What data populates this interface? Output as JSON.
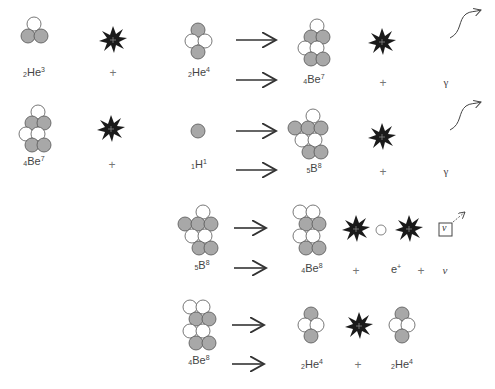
{
  "diagram": {
    "colors": {
      "proton": "#a8a8a8",
      "neutron": "#ffffff",
      "outline": "#555555",
      "energy_burst": "#1a1a1a"
    },
    "rows": [
      {
        "id": "row1",
        "terms": [
          {
            "type": "nucleus",
            "symbol": "He",
            "Z": "2",
            "A": "3",
            "label_x": 34
          },
          {
            "type": "plus",
            "text": "+",
            "x": 113
          },
          {
            "type": "nucleus",
            "symbol": "He",
            "Z": "2",
            "A": "4",
            "label_x": 199
          },
          {
            "type": "arrow"
          },
          {
            "type": "nucleus",
            "symbol": "Be",
            "Z": "4",
            "A": "7",
            "label_x": 314
          },
          {
            "type": "plus",
            "text": "+",
            "x": 383
          },
          {
            "type": "gamma",
            "text": "γ",
            "x": 446
          }
        ]
      },
      {
        "id": "row2",
        "terms": [
          {
            "type": "nucleus",
            "symbol": "Be",
            "Z": "4",
            "A": "7",
            "label_x": 34
          },
          {
            "type": "plus",
            "text": "+",
            "x": 112
          },
          {
            "type": "nucleus",
            "symbol": "H",
            "Z": "1",
            "A": "1",
            "label_x": 199
          },
          {
            "type": "arrow"
          },
          {
            "type": "nucleus",
            "symbol": "B",
            "Z": "5",
            "A": "8",
            "label_x": 314
          },
          {
            "type": "plus",
            "text": "+",
            "x": 383
          },
          {
            "type": "gamma",
            "text": "γ",
            "x": 446
          }
        ]
      },
      {
        "id": "row3",
        "terms": [
          {
            "type": "nucleus",
            "symbol": "B",
            "Z": "5",
            "A": "8",
            "label_x": 202
          },
          {
            "type": "arrow"
          },
          {
            "type": "nucleus",
            "symbol": "Be",
            "Z": "4",
            "A": "8",
            "label_x": 312
          },
          {
            "type": "plus",
            "text": "+",
            "x": 356
          },
          {
            "type": "positron",
            "text": "e",
            "charge": "+",
            "x": 396
          },
          {
            "type": "plus",
            "text": "+",
            "x": 421
          },
          {
            "type": "neutrino",
            "text": "ν",
            "x": 445
          }
        ]
      },
      {
        "id": "row4",
        "terms": [
          {
            "type": "nucleus",
            "symbol": "Be",
            "Z": "4",
            "A": "8",
            "label_x": 199
          },
          {
            "type": "arrow"
          },
          {
            "type": "nucleus",
            "symbol": "He",
            "Z": "2",
            "A": "4",
            "label_x": 312
          },
          {
            "type": "plus",
            "text": "+",
            "x": 358
          },
          {
            "type": "nucleus",
            "symbol": "He",
            "Z": "2",
            "A": "4",
            "label_x": 402
          }
        ]
      }
    ],
    "neutrino_box_text": "ν"
  }
}
